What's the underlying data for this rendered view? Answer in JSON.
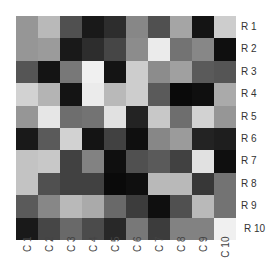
{
  "chart_data": {
    "type": "heatmap",
    "title": "",
    "xlabel": "",
    "ylabel": "",
    "colorscale": "grayscale (0 = black, 255 = white)",
    "rows": [
      "R 1",
      "R 2",
      "R 3",
      "R 4",
      "R 5",
      "R 6",
      "R 7",
      "R 8",
      "R 9",
      "R 10"
    ],
    "columns": [
      "C 1",
      "C 2",
      "C 3",
      "C 4",
      "C 5",
      "C 6",
      "C 7",
      "C 8",
      "C 9",
      "C 10"
    ],
    "values": [
      [
        150,
        185,
        80,
        25,
        45,
        135,
        80,
        165,
        20,
        205
      ],
      [
        150,
        155,
        25,
        45,
        70,
        140,
        235,
        115,
        135,
        15
      ],
      [
        85,
        20,
        120,
        240,
        20,
        205,
        140,
        160,
        90,
        85
      ],
      [
        210,
        180,
        20,
        235,
        185,
        205,
        90,
        10,
        15,
        170
      ],
      [
        150,
        230,
        110,
        115,
        225,
        35,
        200,
        110,
        210,
        150
      ],
      [
        25,
        90,
        210,
        20,
        65,
        15,
        135,
        155,
        35,
        30
      ],
      [
        195,
        200,
        65,
        130,
        15,
        80,
        90,
        65,
        225,
        15
      ],
      [
        195,
        80,
        65,
        65,
        10,
        15,
        185,
        185,
        55,
        115
      ],
      [
        90,
        135,
        185,
        170,
        105,
        60,
        15,
        80,
        185,
        115
      ],
      [
        25,
        70,
        105,
        75,
        40,
        120,
        60,
        130,
        130,
        240
      ]
    ],
    "legend": null,
    "grid": false
  }
}
